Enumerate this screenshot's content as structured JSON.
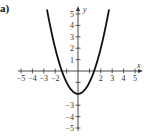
{
  "part_label": "a)",
  "chart_data": {
    "type": "line",
    "title": "",
    "function": "y = x^2 - 2",
    "xlabel": "x",
    "ylabel": "y",
    "xlim": [
      -5,
      5
    ],
    "ylim": [
      -5,
      5
    ],
    "x_ticks": [
      -5,
      -4,
      -3,
      -2,
      -1,
      1,
      2,
      3,
      4,
      5
    ],
    "x_tick_labels": [
      "-5",
      "-4",
      "-3",
      "-2",
      "2",
      "3",
      "4",
      "5"
    ],
    "y_ticks": [
      -5,
      -4,
      -3,
      -2,
      -1,
      1,
      2,
      3,
      4,
      5
    ],
    "y_tick_labels": [
      "5",
      "4",
      "3",
      "2",
      "1",
      "-3",
      "-4",
      "-5"
    ],
    "grid": false,
    "series": [
      {
        "name": "y = x^2 - 2",
        "x": [
          -2.7,
          -2,
          -1.5,
          -1,
          -0.5,
          0,
          0.5,
          1,
          1.5,
          2,
          2.7
        ],
        "y": [
          5.29,
          2,
          0.25,
          -1,
          -1.75,
          -2,
          -1.75,
          -1,
          0.25,
          2,
          5.29
        ],
        "color": "#111111"
      }
    ]
  }
}
